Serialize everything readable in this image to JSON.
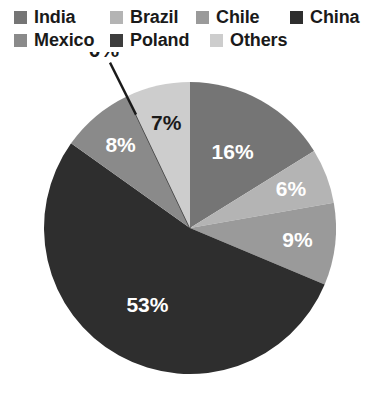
{
  "legend": {
    "items": [
      {
        "label": "India",
        "color": "#757575",
        "swatch_name": "legend-swatch-india"
      },
      {
        "label": "Brazil",
        "color": "#b4b4b4",
        "swatch_name": "legend-swatch-brazil"
      },
      {
        "label": "Chile",
        "color": "#9a9a9a",
        "swatch_name": "legend-swatch-chile"
      },
      {
        "label": "China",
        "color": "#2e2e2e",
        "swatch_name": "legend-swatch-china"
      },
      {
        "label": "Mexico",
        "color": "#8a8a8a",
        "swatch_name": "legend-swatch-mexico"
      },
      {
        "label": "Poland",
        "color": "#3d3d3d",
        "swatch_name": "legend-swatch-poland"
      },
      {
        "label": "Others",
        "color": "#cdcdcd",
        "swatch_name": "legend-swatch-others"
      }
    ]
  },
  "chart_data": {
    "type": "pie",
    "title": "",
    "categories": [
      "India",
      "Brazil",
      "Chile",
      "China",
      "Mexico",
      "Poland",
      "Others"
    ],
    "values": [
      16,
      6,
      9,
      53,
      8,
      0,
      7
    ],
    "value_unit": "%",
    "data_labels": [
      "16%",
      "6%",
      "9%",
      "53%",
      "8%",
      "0%",
      "7%"
    ],
    "colors": [
      "#757575",
      "#b4b4b4",
      "#9a9a9a",
      "#2e2e2e",
      "#8a8a8a",
      "#3d3d3d",
      "#cdcdcd"
    ],
    "label_colors": [
      "white",
      "white",
      "white",
      "white",
      "white",
      "black",
      "black"
    ],
    "start_angle_deg": 0,
    "direction": "clockwise",
    "legend_position": "top",
    "grid": false,
    "callouts": [
      {
        "category": "Poland",
        "label": "0%",
        "leader_line": true
      }
    ]
  },
  "labels": {
    "india": "16%",
    "brazil": "6%",
    "chile": "9%",
    "china": "53%",
    "mexico": "8%",
    "poland": "0%",
    "others": "7%"
  }
}
